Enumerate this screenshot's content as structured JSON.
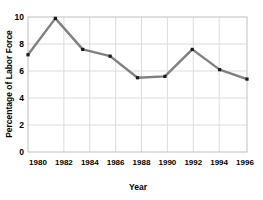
{
  "chart_data": {
    "type": "line",
    "title": "",
    "xlabel": "Year",
    "ylabel": "Percentage of Labor Force",
    "categories": [
      "1980",
      "1982",
      "1984",
      "1986",
      "1988",
      "1990",
      "1992",
      "1994",
      "1996"
    ],
    "x": [
      1980,
      1982,
      1984,
      1986,
      1988,
      1990,
      1992,
      1994,
      1996
    ],
    "values": [
      7.2,
      9.9,
      7.6,
      7.1,
      5.5,
      5.6,
      7.6,
      6.1,
      5.4
    ],
    "series": [
      {
        "name": "Percentage of Labor Force",
        "values": [
          7.2,
          9.9,
          7.6,
          7.1,
          5.5,
          5.6,
          7.6,
          6.1,
          5.4
        ]
      }
    ],
    "xlim": [
      1980,
      1996
    ],
    "ylim": [
      0,
      10
    ],
    "ytick_labels": [
      "0",
      "2",
      "4",
      "6",
      "8",
      "10"
    ],
    "ytick_values": [
      0,
      2,
      4,
      6,
      8,
      10
    ],
    "xtick_labels": [
      "1980",
      "1982",
      "1984",
      "1986",
      "1988",
      "1990",
      "1992",
      "1994",
      "1996"
    ],
    "grid": true,
    "legend": "none",
    "line_color": "#808080",
    "marker_color": "#1a1a1a",
    "marker_shape": "square",
    "grid_color": "#d9d9d9",
    "axis_color": "#bfbfbf",
    "background_color": "#ffffff",
    "text_color": "#000000"
  }
}
